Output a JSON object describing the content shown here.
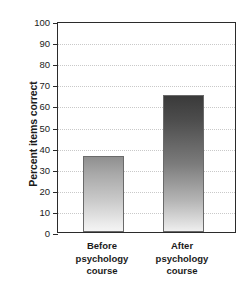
{
  "chart_data": {
    "type": "bar",
    "title": "",
    "xlabel": "",
    "ylabel": "Percent items correct",
    "categories": [
      "Before psychology course",
      "After psychology course"
    ],
    "category_lines": [
      [
        "Before",
        "psychology",
        "course"
      ],
      [
        "After",
        "psychology",
        "course"
      ]
    ],
    "values": [
      36,
      65
    ],
    "ylim": [
      0,
      100
    ],
    "yticks": [
      0,
      10,
      20,
      30,
      40,
      50,
      60,
      70,
      80,
      90,
      100
    ],
    "ytick_labels": [
      "0",
      "10",
      "20",
      "30",
      "40",
      "50",
      "60",
      "70",
      "80",
      "90",
      "100"
    ],
    "grid": true,
    "grid_axis": "y",
    "legend": false,
    "bar_colors": [
      "#b4b4b4",
      "#5a5a5a"
    ],
    "bar_edge_color": "#6a6a6a",
    "axis_color": "#2b2b2b",
    "grid_color": "#c9c9c9",
    "background": "#ffffff"
  }
}
